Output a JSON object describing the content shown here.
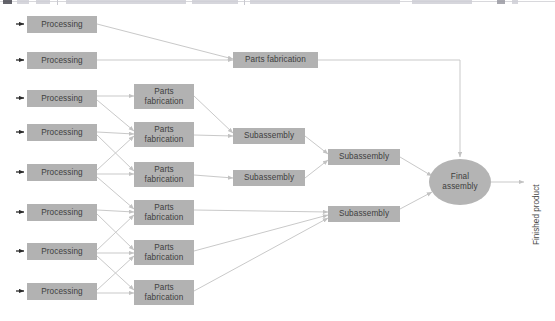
{
  "diagram": {
    "colors": {
      "node_fill": "#b2b2b2",
      "node_text": "#3e3e3e",
      "edge": "#c9c9c9",
      "marker": "#2b2b2b",
      "background": "#ffffff"
    },
    "labels": {
      "processing": "Processing",
      "parts_fabrication": "Parts\nfabrication",
      "parts_fabrication_single": "Parts  fabrication",
      "subassembly": "Subassembly",
      "final_assembly": "Final\nassembly",
      "finished_product": "Finished product"
    },
    "processing_nodes": [
      {
        "label": "Processing",
        "x": 27,
        "y": 16,
        "w": 70,
        "h": 17
      },
      {
        "label": "Processing",
        "x": 27,
        "y": 52,
        "w": 70,
        "h": 17
      },
      {
        "label": "Processing",
        "x": 27,
        "y": 90,
        "w": 70,
        "h": 17
      },
      {
        "label": "Processing",
        "x": 27,
        "y": 124,
        "w": 70,
        "h": 17
      },
      {
        "label": "Processing",
        "x": 27,
        "y": 164,
        "w": 70,
        "h": 17
      },
      {
        "label": "Processing",
        "x": 27,
        "y": 204,
        "w": 70,
        "h": 17
      },
      {
        "label": "Processing",
        "x": 27,
        "y": 243,
        "w": 70,
        "h": 17
      },
      {
        "label": "Processing",
        "x": 27,
        "y": 283,
        "w": 70,
        "h": 17
      }
    ],
    "parts_fabrication_nodes": [
      {
        "label": "Parts\nfabrication",
        "x": 134,
        "y": 84,
        "w": 60,
        "h": 25
      },
      {
        "label": "Parts\nfabrication",
        "x": 134,
        "y": 122,
        "w": 60,
        "h": 25
      },
      {
        "label": "Parts\nfabrication",
        "x": 134,
        "y": 162,
        "w": 60,
        "h": 25
      },
      {
        "label": "Parts\nfabrication",
        "x": 134,
        "y": 200,
        "w": 60,
        "h": 25
      },
      {
        "label": "Parts\nfabrication",
        "x": 134,
        "y": 240,
        "w": 60,
        "h": 25
      },
      {
        "label": "Parts\nfabrication",
        "x": 134,
        "y": 280,
        "w": 60,
        "h": 25
      }
    ],
    "parts_fabrication_top": {
      "label": "Parts  fabrication",
      "x": 233,
      "y": 52,
      "w": 85,
      "h": 16
    },
    "subassembly_nodes": [
      {
        "label": "Subassembly",
        "x": 233,
        "y": 128,
        "w": 72,
        "h": 16
      },
      {
        "label": "Subassembly",
        "x": 233,
        "y": 170,
        "w": 72,
        "h": 16
      },
      {
        "label": "Subassembly",
        "x": 328,
        "y": 149,
        "w": 72,
        "h": 16
      },
      {
        "label": "Subassembly",
        "x": 328,
        "y": 206,
        "w": 72,
        "h": 16
      }
    ],
    "final_assembly": {
      "label": "Final\nassembly",
      "x": 429,
      "y": 159,
      "w": 62,
      "h": 46
    },
    "finished_product": {
      "label": "Finished product",
      "x": 532,
      "y": 245
    },
    "input_markers": [
      {
        "x": 17,
        "y": 20
      },
      {
        "x": 17,
        "y": 56
      },
      {
        "x": 17,
        "y": 94
      },
      {
        "x": 17,
        "y": 128
      },
      {
        "x": 17,
        "y": 168
      },
      {
        "x": 17,
        "y": 208
      },
      {
        "x": 17,
        "y": 247
      },
      {
        "x": 17,
        "y": 287
      }
    ],
    "edges": [
      {
        "from": "processing-1",
        "to": "parts-fabrication-top"
      },
      {
        "from": "processing-2",
        "to": "parts-fabrication-top"
      },
      {
        "from": "parts-fabrication-top",
        "to": "final-assembly"
      },
      {
        "from": "processing-3",
        "to": "parts-fabrication-1"
      },
      {
        "from": "processing-3",
        "to": "parts-fabrication-2"
      },
      {
        "from": "processing-4",
        "to": "parts-fabrication-2"
      },
      {
        "from": "processing-4",
        "to": "parts-fabrication-3"
      },
      {
        "from": "processing-5",
        "to": "parts-fabrication-2"
      },
      {
        "from": "processing-5",
        "to": "parts-fabrication-3"
      },
      {
        "from": "processing-5",
        "to": "parts-fabrication-4"
      },
      {
        "from": "processing-6",
        "to": "parts-fabrication-4"
      },
      {
        "from": "processing-6",
        "to": "parts-fabrication-5"
      },
      {
        "from": "processing-7",
        "to": "parts-fabrication-5"
      },
      {
        "from": "processing-7",
        "to": "parts-fabrication-6"
      },
      {
        "from": "processing-8",
        "to": "parts-fabrication-6"
      },
      {
        "from": "parts-fabrication-1",
        "to": "subassembly-1"
      },
      {
        "from": "parts-fabrication-2",
        "to": "subassembly-1"
      },
      {
        "from": "parts-fabrication-3",
        "to": "subassembly-2"
      },
      {
        "from": "parts-fabrication-4",
        "to": "subassembly-4"
      },
      {
        "from": "parts-fabrication-5",
        "to": "subassembly-4"
      },
      {
        "from": "parts-fabrication-6",
        "to": "subassembly-4"
      },
      {
        "from": "subassembly-1",
        "to": "subassembly-3"
      },
      {
        "from": "subassembly-2",
        "to": "subassembly-3"
      },
      {
        "from": "subassembly-3",
        "to": "final-assembly"
      },
      {
        "from": "subassembly-4",
        "to": "final-assembly"
      },
      {
        "from": "final-assembly",
        "to": "finished-product"
      }
    ]
  }
}
